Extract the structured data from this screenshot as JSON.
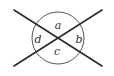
{
  "diagram": {
    "type": "intersecting-lines-with-circle",
    "colors": {
      "line": "#2a2a2a",
      "circle": "#555555",
      "background": "#ffffff"
    },
    "lines": [
      {
        "id": "line-1",
        "x1": 14,
        "y1": 10,
        "x2": 102,
        "y2": 66
      },
      {
        "id": "line-2",
        "x1": 14,
        "y1": 66,
        "x2": 102,
        "y2": 10
      }
    ],
    "circle": {
      "cx": 58,
      "cy": 38,
      "r": 26
    },
    "angle_labels": [
      {
        "text": "a",
        "x": 58,
        "y": 29
      },
      {
        "text": "b",
        "x": 79,
        "y": 43
      },
      {
        "text": "c",
        "x": 57,
        "y": 55
      },
      {
        "text": "d",
        "x": 38,
        "y": 43
      }
    ]
  }
}
